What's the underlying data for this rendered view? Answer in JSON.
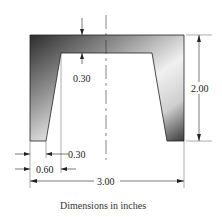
{
  "diagram": {
    "type": "cross-section",
    "caption": "Dimensions in inches",
    "dimensions": {
      "flange_thickness": "0.30",
      "height": "2.00",
      "leg_bottom_width": "0.30",
      "leg_top_offset": "0.60",
      "overall_width": "3.00"
    },
    "colors": {
      "shade_dark": "#3a3a3a",
      "shade_light": "#f2f2f2",
      "line": "#222222"
    }
  }
}
